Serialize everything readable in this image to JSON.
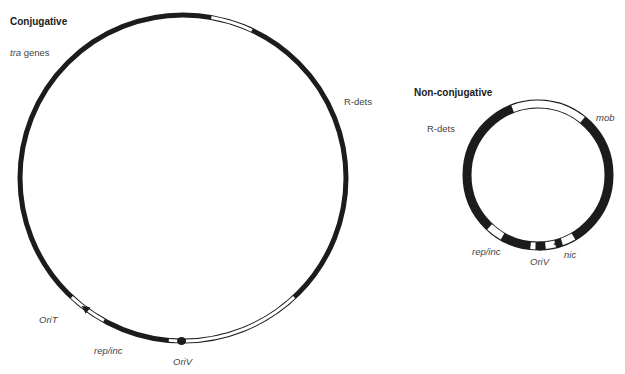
{
  "diagram": {
    "conjugative": {
      "title": "Conjugative",
      "labels": {
        "tra_italic": "tra",
        "tra_rest": " genes",
        "rdets": "R-dets",
        "orit": "OriT",
        "repinc": "rep/inc",
        "oriv": "OriV"
      },
      "circle": {
        "cx": 183,
        "cy": 178,
        "r": 163,
        "stroke": 5
      },
      "white_segments_deg": [
        [
          -80,
          -65
        ],
        [
          47,
          89
        ],
        [
          92,
          95
        ],
        [
          119,
          133
        ]
      ],
      "markers": [
        {
          "type": "dot",
          "name": "OriV",
          "angle_deg": 90.5
        },
        {
          "type": "triangle",
          "name": "OriT",
          "angle_deg": 127
        }
      ]
    },
    "nonconjugative": {
      "title": "Non-conjugative",
      "labels": {
        "rdets": "R-dets",
        "mob": "mob",
        "repinc": "rep/inc",
        "oriv": "OriV",
        "nic": "nic"
      },
      "circle": {
        "cx": 538,
        "cy": 175,
        "r": 71,
        "stroke": 9
      },
      "white_segments_deg": [
        [
          -111,
          -51
        ],
        [
          120,
          133
        ],
        [
          92,
          96
        ],
        [
          76,
          84
        ],
        [
          60,
          72
        ]
      ],
      "markers": [
        {
          "type": "dot",
          "name": "OriV",
          "angle_deg": 88
        },
        {
          "type": "triangle",
          "name": "nic",
          "angle_deg": 74
        }
      ]
    },
    "colors": {
      "dna_black": "#1c1c1c",
      "background": "#ffffff"
    }
  }
}
